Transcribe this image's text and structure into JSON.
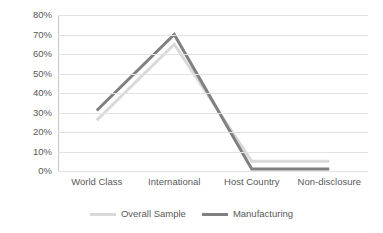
{
  "chart_data": {
    "type": "line",
    "title": "",
    "subtitle": "",
    "xlabel": "",
    "ylabel": "",
    "categories": [
      "World Class",
      "International",
      "Host Country",
      "Non-disclosure"
    ],
    "series": [
      {
        "name": "Overall Sample",
        "values": [
          26,
          65,
          5,
          5
        ],
        "color": "#d9d9d9"
      },
      {
        "name": "Manufacturing",
        "values": [
          31,
          70,
          1,
          1
        ],
        "color": "#808080"
      }
    ],
    "ylim": [
      0,
      80
    ],
    "ytick_values": [
      0,
      10,
      20,
      30,
      40,
      50,
      60,
      70,
      80
    ],
    "ytick_labels": [
      "0%",
      "10%",
      "20%",
      "30%",
      "40%",
      "50%",
      "60%",
      "70%",
      "80%"
    ],
    "ytick_format": "percent",
    "grid": true,
    "grid_axis": "y",
    "grid_color": "#e3e3e3",
    "legend_position": "bottom",
    "background": "#ffffff",
    "axis_label_color": "#595959"
  },
  "legend": {
    "items": [
      {
        "label": "Overall Sample",
        "color": "#d9d9d9"
      },
      {
        "label": "Manufacturing",
        "color": "#808080"
      }
    ]
  }
}
